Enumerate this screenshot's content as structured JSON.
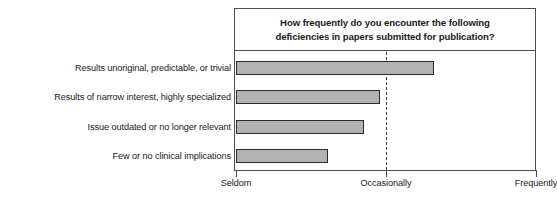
{
  "chart_data": {
    "type": "bar",
    "orientation": "horizontal",
    "title": "How frequently do you encounter the following deficiencies in papers submitted for publication?",
    "title_line1": "How frequently do you encounter the following",
    "title_line2": "deficiencies in papers submitted for publication?",
    "xlabel": "",
    "ylabel": "",
    "grid": true,
    "gridlines_at": [
      "Occasionally"
    ],
    "legend": null,
    "axis_type": "ordinal-scale",
    "xlim": [
      1,
      3
    ],
    "tick_labels": [
      "Seldom",
      "Occasionally",
      "Frequently"
    ],
    "tick_values": [
      1,
      2,
      3
    ],
    "categories": [
      "Results unoriginal, predictable, or trivial",
      "Results of narrow interest, highly specialized",
      "Issue outdated or no longer relevant",
      "Few or no clinical implications"
    ],
    "values": [
      2.32,
      1.96,
      1.85,
      1.61
    ],
    "bar_color": "#b2b2b2",
    "bar_border_color": "#2b2b2b",
    "frame_color": "#4d4d4d",
    "background": "#ffffff"
  }
}
